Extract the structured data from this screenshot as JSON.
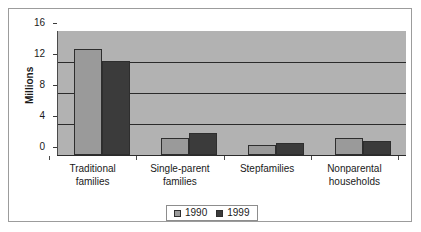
{
  "chart_data": {
    "type": "bar",
    "title": "",
    "subtitle": "",
    "xlabel": "",
    "ylabel": "Millions",
    "ylim": [
      0,
      16
    ],
    "yticks": [
      0,
      4,
      8,
      12,
      16
    ],
    "ytick_labels": [
      "0",
      "4",
      "8",
      "12",
      "16"
    ],
    "grid": true,
    "grid_axis": "y",
    "legend_position": "bottom-center",
    "categories": [
      "Traditional families",
      "Single-parent families",
      "Stepfamilies",
      "Nonparental households"
    ],
    "category_lines": [
      [
        "Traditional",
        "families"
      ],
      [
        "Single-parent",
        "families"
      ],
      [
        "Stepfamilies",
        ""
      ],
      [
        "Nonparental",
        "households"
      ]
    ],
    "series": [
      {
        "name": "1990",
        "color": "#9a9a9a",
        "values": [
          13.7,
          2.2,
          1.3,
          2.25
        ]
      },
      {
        "name": "1999",
        "color": "#3b3b3b",
        "values": [
          12.1,
          2.8,
          1.5,
          1.8
        ]
      }
    ]
  },
  "legend": {
    "entries": [
      {
        "label": "1990",
        "swatch": "legend-swatch-1990"
      },
      {
        "label": "1999",
        "swatch": "legend-swatch-1999"
      }
    ]
  },
  "colors": {
    "plot_background": "#b2b2b2",
    "figure_background": "#ffffff",
    "frame_border": "#9c9c9c",
    "gridline": "#2b2b2b",
    "axis": "#2b2b2b",
    "text": "#1a1a1a",
    "series_1990": "#9a9a9a",
    "series_1999": "#3b3b3b"
  }
}
